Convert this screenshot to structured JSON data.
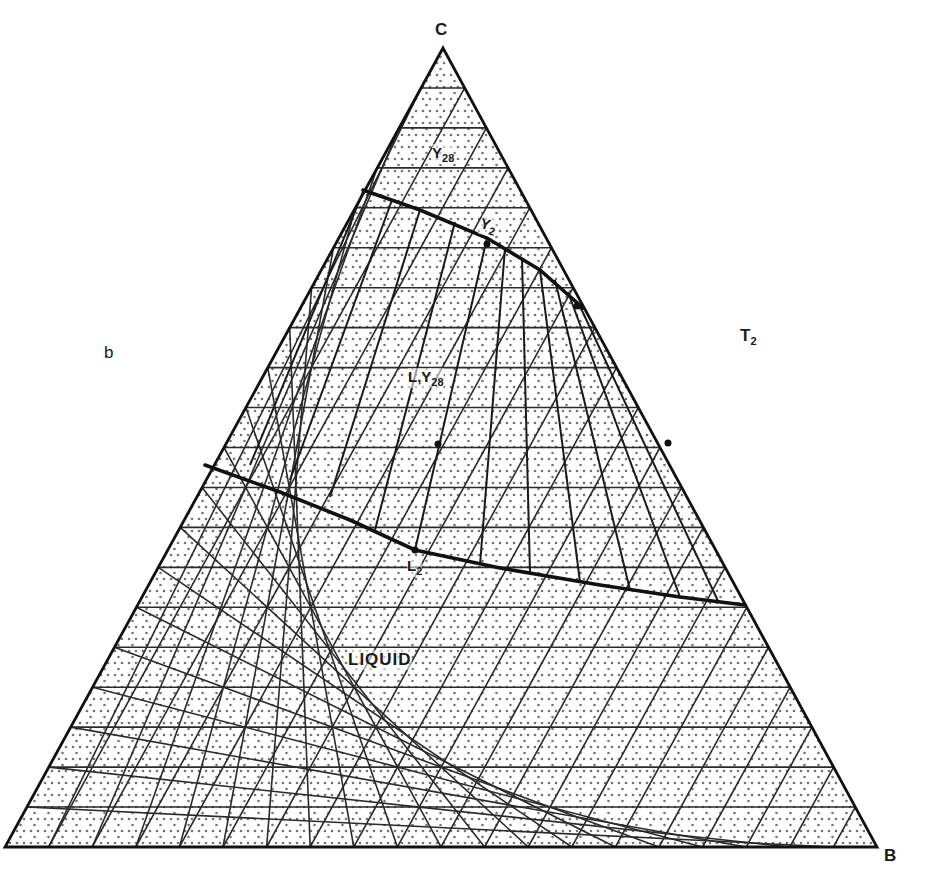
{
  "diagram": {
    "type": "ternary-phase-diagram",
    "vertices": {
      "top": {
        "label": "C",
        "x": 443,
        "y": 48
      },
      "left": {
        "label": "",
        "x": 5,
        "y": 847
      },
      "right": {
        "label": "B",
        "x": 877,
        "y": 847
      }
    },
    "grid_divisions": 20,
    "colors": {
      "ink": "#1a1a1a",
      "grid": "#2a2a2a",
      "stipple": "#5a5a5a",
      "background": "#ffffff"
    },
    "labels": {
      "corner_c": "C",
      "corner_b": "B",
      "panel": "b",
      "temperature": {
        "main": "T",
        "sub": "2"
      },
      "region_top": {
        "main": "Y",
        "sub": "28"
      },
      "upper_point": {
        "main": "Y",
        "sub": "2"
      },
      "center_point": {
        "main": "L,Y",
        "sub": "28"
      },
      "lower_point": {
        "main": "L",
        "sub": "2"
      },
      "liquid_region": "LIQUID"
    },
    "curves": {
      "upper_boundary": [
        [
          363,
          190
        ],
        [
          420,
          210
        ],
        [
          487,
          238
        ],
        [
          540,
          270
        ],
        [
          583,
          308
        ]
      ],
      "lower_boundary": [
        [
          205,
          465
        ],
        [
          280,
          492
        ],
        [
          350,
          520
        ],
        [
          415,
          550
        ],
        [
          500,
          568
        ],
        [
          600,
          585
        ],
        [
          680,
          597
        ],
        [
          745,
          605
        ]
      ]
    },
    "tie_lines": [
      [
        [
          250,
          465
        ],
        [
          363,
          192
        ]
      ],
      [
        [
          290,
          480
        ],
        [
          392,
          200
        ]
      ],
      [
        [
          330,
          497
        ],
        [
          420,
          210
        ]
      ],
      [
        [
          375,
          530
        ],
        [
          455,
          222
        ]
      ],
      [
        [
          415,
          550
        ],
        [
          487,
          238
        ]
      ],
      [
        [
          480,
          565
        ],
        [
          505,
          248
        ]
      ],
      [
        [
          530,
          573
        ],
        [
          522,
          258
        ]
      ],
      [
        [
          580,
          582
        ],
        [
          540,
          270
        ]
      ],
      [
        [
          630,
          590
        ],
        [
          555,
          280
        ]
      ],
      [
        [
          680,
          597
        ],
        [
          568,
          292
        ]
      ],
      [
        [
          718,
          601
        ],
        [
          578,
          302
        ]
      ]
    ],
    "points": [
      {
        "name": "upper-point",
        "x": 487,
        "y": 244
      },
      {
        "name": "center-point",
        "x": 438,
        "y": 444
      },
      {
        "name": "lower-point",
        "x": 415,
        "y": 550
      },
      {
        "name": "edge-marker-right",
        "x": 668,
        "y": 443
      },
      {
        "name": "edge-marker-right-top",
        "x": 577,
        "y": 306
      }
    ]
  }
}
